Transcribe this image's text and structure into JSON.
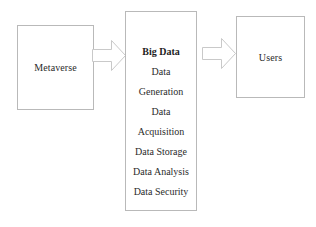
{
  "diagram": {
    "type": "flow",
    "nodes": [
      {
        "id": "metaverse",
        "label": "Metaverse"
      },
      {
        "id": "big-data",
        "title": "Big Data",
        "items": [
          "Data",
          "Generation",
          "Data",
          "Acquisition",
          "Data Storage",
          "Data Analysis",
          "Data Security"
        ]
      },
      {
        "id": "users",
        "label": "Users"
      }
    ],
    "connectors": [
      {
        "id": "metaverse-to-big-data",
        "icon": "right-block-arrow-icon",
        "from": "metaverse",
        "to": "big-data"
      },
      {
        "id": "big-data-to-users",
        "icon": "right-block-arrow-icon",
        "from": "big-data",
        "to": "users"
      }
    ],
    "colors": {
      "background": "#ffffff",
      "box_border": "#b9b9b9",
      "arrow_stroke": "#c9c9c9",
      "arrow_fill": "#ffffff",
      "text": "#2b2b2b",
      "title_text": "#1d1d1d"
    }
  }
}
